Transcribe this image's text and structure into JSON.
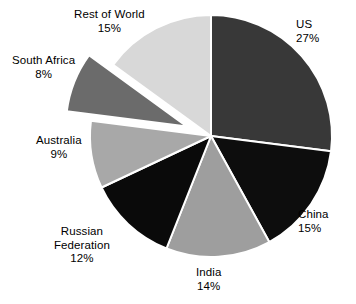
{
  "chart_data": {
    "type": "pie",
    "title": "",
    "subtitle": "",
    "xlabel": "",
    "ylabel": "",
    "legend_position": "none",
    "grid": false,
    "start_angle_deg": 0,
    "direction": "clockwise",
    "units": "percent",
    "categories": [
      "US",
      "China",
      "India",
      "Russian Federation",
      "Australia",
      "South Africa",
      "Rest of World"
    ],
    "values": [
      27,
      15,
      14,
      12,
      9,
      8,
      15
    ],
    "total": 100,
    "slices": [
      {
        "label": "US",
        "value": 27,
        "value_text": "27%",
        "color": "#383838",
        "exploded": false,
        "start_deg": 0,
        "end_deg": 97.2
      },
      {
        "label": "China",
        "value": 15,
        "value_text": "15%",
        "color": "#0d0d0d",
        "exploded": false,
        "start_deg": 97.2,
        "end_deg": 151.2
      },
      {
        "label": "India",
        "value": 14,
        "value_text": "14%",
        "color": "#9e9e9e",
        "exploded": false,
        "start_deg": 151.2,
        "end_deg": 201.6
      },
      {
        "label": "Russian Federation",
        "value": 12,
        "value_text": "12%",
        "color": "#0a0a0a",
        "exploded": false,
        "start_deg": 201.6,
        "end_deg": 244.8
      },
      {
        "label": "Australia",
        "value": 9,
        "value_text": "9%",
        "color": "#a8a8a8",
        "exploded": false,
        "start_deg": 244.8,
        "end_deg": 277.2
      },
      {
        "label": "South Africa",
        "value": 8,
        "value_text": "8%",
        "color": "#6b6b6b",
        "exploded": true,
        "start_deg": 277.2,
        "end_deg": 306.0
      },
      {
        "label": "Rest of World",
        "value": 15,
        "value_text": "15%",
        "color": "#d8d8d8",
        "exploded": false,
        "start_deg": 306.0,
        "end_deg": 360.0
      }
    ],
    "labels": {
      "us": {
        "name": "US",
        "pct": "27%"
      },
      "china": {
        "name": "China",
        "pct": "15%"
      },
      "india": {
        "name": "India",
        "pct": "14%"
      },
      "russia": {
        "name": "Russian",
        "name2": "Federation",
        "pct": "12%"
      },
      "australia": {
        "name": "Australia",
        "pct": "9%"
      },
      "safrica": {
        "name": "South Africa",
        "pct": "8%"
      },
      "row": {
        "name": "Rest of World",
        "pct": "15%"
      }
    },
    "style": {
      "background": "#ffffff",
      "separator_color": "#ffffff",
      "text_color": "#000000"
    }
  }
}
